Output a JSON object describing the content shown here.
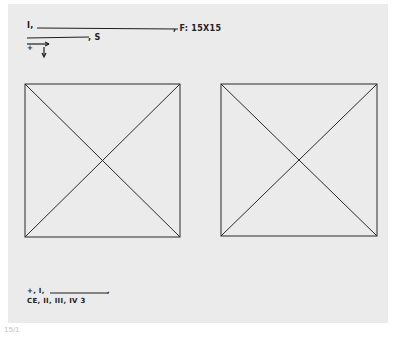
{
  "header": {
    "line1_prefix": "I,",
    "line1_suffix": ", F: 15X15",
    "line2_suffix": ", S",
    "arrow_marker": "+"
  },
  "figures": [
    {
      "name": "left-square",
      "shape": "square-with-diagonals",
      "x": 25,
      "y": 84,
      "width": 155,
      "height": 153
    },
    {
      "name": "right-square",
      "shape": "square-with-diagonals",
      "x": 221,
      "y": 84,
      "width": 156,
      "height": 152
    }
  ],
  "footer_notes": {
    "line1_prefix": "+, I,",
    "line1_suffix": ",",
    "line2": "CE, II, III, IV 3"
  },
  "caption": "15/1",
  "colors": {
    "paper": "#ebebeb",
    "ink": "#1e1e1e",
    "caption": "#c4c4c4",
    "background": "#ffffff"
  }
}
